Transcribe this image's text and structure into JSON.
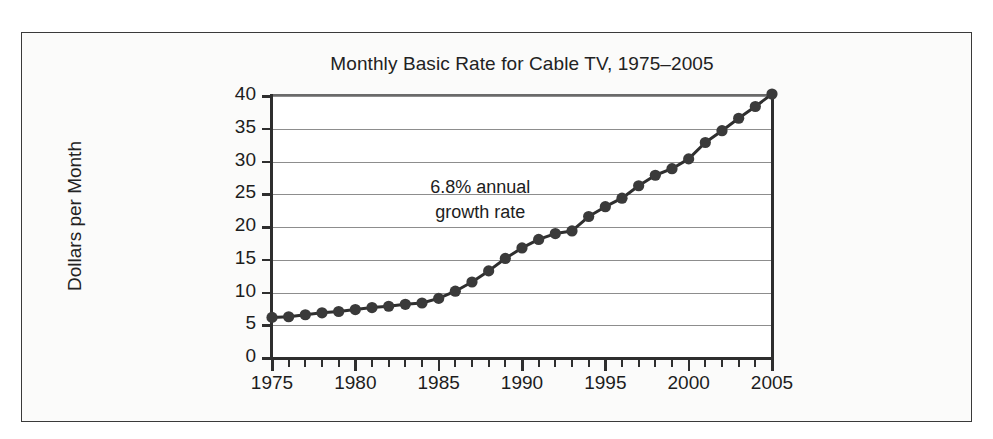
{
  "chart_data": {
    "type": "line",
    "title": "Monthly Basic Rate for Cable TV, 1975–2005",
    "xlabel": "",
    "ylabel": "Dollars per Month",
    "xlim": [
      1975,
      2005
    ],
    "ylim": [
      0,
      40
    ],
    "grid": true,
    "legend": null,
    "marker": "filled-circle",
    "line_color": "#2f2f2f",
    "marker_color": "#3a3a3a",
    "annotations": [
      {
        "text_line1": "6.8% annual",
        "text_line2": "growth rate",
        "x": 1987.5,
        "y": 26
      }
    ],
    "ytick_labels": [
      "0",
      "5",
      "10",
      "15",
      "20",
      "25",
      "30",
      "35",
      "40"
    ],
    "yticks": [
      0,
      5,
      10,
      15,
      20,
      25,
      30,
      35,
      40
    ],
    "xtick_labels": [
      "1975",
      "1980",
      "1985",
      "1990",
      "1995",
      "2000",
      "2005"
    ],
    "xticks": [
      1975,
      1980,
      1985,
      1990,
      1995,
      2000,
      2005
    ],
    "xtick_minor_step": 1,
    "x": [
      1975,
      1976,
      1977,
      1978,
      1979,
      1980,
      1981,
      1982,
      1983,
      1984,
      1985,
      1986,
      1987,
      1988,
      1989,
      1990,
      1991,
      1992,
      1993,
      1994,
      1995,
      1996,
      1997,
      1998,
      1999,
      2000,
      2001,
      2002,
      2003,
      2004,
      2005
    ],
    "values": [
      6.2,
      6.3,
      6.6,
      6.9,
      7.1,
      7.4,
      7.7,
      7.9,
      8.2,
      8.4,
      9.1,
      10.2,
      11.6,
      13.3,
      15.2,
      16.8,
      18.1,
      19.0,
      19.4,
      21.6,
      23.1,
      24.4,
      26.3,
      27.9,
      28.9,
      30.4,
      32.9,
      34.7,
      36.6,
      38.4,
      40.3
    ],
    "units": "dollars per month",
    "source_note": ""
  },
  "figure": {
    "title": "Monthly Basic Rate for Cable TV, 1975–2005",
    "y_axis_label": "Dollars per Month",
    "annotation_line1": "6.8% annual",
    "annotation_line2": "growth rate"
  },
  "colors": {
    "frame": "#3a3a3a",
    "panel_background": "#fbfbfa",
    "plot_background": "#ffffff",
    "gridline": "#8d8d8d",
    "axis": "#2e2e2e",
    "text": "#1d1d1d",
    "series": "#2f2f2f"
  }
}
